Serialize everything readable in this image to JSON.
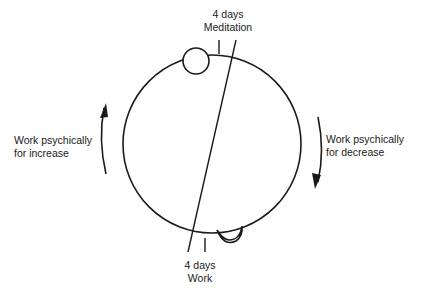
{
  "diagram": {
    "top_label": {
      "line1": "4 days",
      "line2": "Meditation"
    },
    "bottom_label": {
      "line1": "4 days",
      "line2": "Work"
    },
    "left_label": {
      "line1": "Work psychically",
      "line2": "for increase"
    },
    "right_label": {
      "line1": "Work psychically",
      "line2": "for decrease"
    },
    "icons": [
      "full-moon-icon",
      "crescent-moon-icon",
      "arrow-up-icon",
      "arrow-down-icon"
    ],
    "colors": {
      "stroke": "#1a1a1a",
      "background": "#ffffff"
    }
  }
}
